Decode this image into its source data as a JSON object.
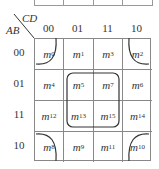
{
  "diagram": {
    "type": "karnaugh-map",
    "row_variable": "AB",
    "col_variable": "CD",
    "col_headers": [
      "00",
      "01",
      "11",
      "10"
    ],
    "row_headers": [
      "00",
      "01",
      "11",
      "10"
    ],
    "cells": [
      [
        "m0",
        "m1",
        "m3",
        "m2"
      ],
      [
        "m4",
        "m5",
        "m7",
        "m6"
      ],
      [
        "m12",
        "m13",
        "m15",
        "m14"
      ],
      [
        "m8",
        "m9",
        "m11",
        "m10"
      ]
    ],
    "cell_labels": [
      [
        {
          "m": "m",
          "s": "0"
        },
        {
          "m": "m",
          "s": "1"
        },
        {
          "m": "m",
          "s": "3"
        },
        {
          "m": "m",
          "s": "2"
        }
      ],
      [
        {
          "m": "m",
          "s": "4"
        },
        {
          "m": "m",
          "s": "5"
        },
        {
          "m": "m",
          "s": "7"
        },
        {
          "m": "m",
          "s": "6"
        }
      ],
      [
        {
          "m": "m",
          "s": "12"
        },
        {
          "m": "m",
          "s": "13"
        },
        {
          "m": "m",
          "s": "15"
        },
        {
          "m": "m",
          "s": "14"
        }
      ],
      [
        {
          "m": "m",
          "s": "8"
        },
        {
          "m": "m",
          "s": "9"
        },
        {
          "m": "m",
          "s": "11"
        },
        {
          "m": "m",
          "s": "10"
        }
      ]
    ],
    "groupings": [
      {
        "name": "center-quad",
        "cells": [
          "m5",
          "m7",
          "m13",
          "m15"
        ]
      },
      {
        "name": "corner-quad",
        "cells": [
          "m0",
          "m2",
          "m8",
          "m10"
        ]
      }
    ]
  }
}
